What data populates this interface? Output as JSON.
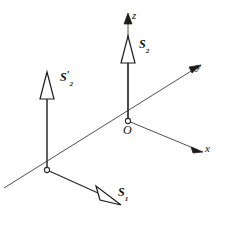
{
  "figure": {
    "background_color": "#ffffff",
    "line_color": "#3a3a3a",
    "text_color": "#111111"
  },
  "axes": {
    "z": {
      "label": "z",
      "direction": "up",
      "arrowhead": "solid"
    },
    "y": {
      "label": "y",
      "direction": "upper-right",
      "arrowhead": "solid"
    },
    "x": {
      "label": "x",
      "direction": "lower-right",
      "arrowhead": "solid"
    }
  },
  "origin": {
    "label": "O",
    "marker": "open-circle"
  },
  "nodes": [
    {
      "name": "origin-node",
      "marker": "open-circle"
    },
    {
      "name": "second-node",
      "marker": "open-circle"
    }
  ],
  "vectors": [
    {
      "id": "s2",
      "label_base": "S",
      "label_sub": "2",
      "label_prime": "",
      "direction": "up",
      "arrowhead": "open-triangle",
      "anchor": "origin-node"
    },
    {
      "id": "s2-prime",
      "label_base": "S",
      "label_sub": "2",
      "label_prime": "′",
      "direction": "up",
      "arrowhead": "open-triangle",
      "anchor": "second-node"
    },
    {
      "id": "s1",
      "label_base": "S",
      "label_sub": "1",
      "label_prime": "",
      "direction": "lower-right",
      "arrowhead": "open-triangle",
      "anchor": "second-node"
    }
  ]
}
